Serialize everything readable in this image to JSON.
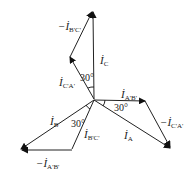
{
  "diagram": {
    "type": "phasor-diagram",
    "phasors": [
      {
        "id": "iC",
        "label": "İ",
        "sub": "C",
        "prefix": ""
      },
      {
        "id": "neg_iBC",
        "label": "İ",
        "sub": "B'C'",
        "prefix": "−"
      },
      {
        "id": "iCA",
        "label": "İ",
        "sub": "C'A'",
        "prefix": ""
      },
      {
        "id": "iAB",
        "label": "İ",
        "sub": "A'B'",
        "prefix": ""
      },
      {
        "id": "neg_iCA",
        "label": "İ",
        "sub": "C'A'",
        "prefix": "−"
      },
      {
        "id": "iA",
        "label": "İ",
        "sub": "A",
        "prefix": ""
      },
      {
        "id": "iB",
        "label": "İ",
        "sub": "B",
        "prefix": ""
      },
      {
        "id": "iBC",
        "label": "İ",
        "sub": "B'C'",
        "prefix": ""
      },
      {
        "id": "neg_iAB",
        "label": "İ",
        "sub": "A'B'",
        "prefix": "−"
      }
    ],
    "angles": [
      {
        "id": "angle_top",
        "text": "30°"
      },
      {
        "id": "angle_right",
        "text": "30°"
      },
      {
        "id": "angle_left",
        "text": "30°"
      }
    ]
  }
}
